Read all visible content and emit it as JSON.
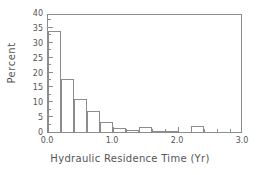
{
  "chart_data": {
    "type": "bar",
    "title": "",
    "subtitle": "",
    "xlabel": "Hydraulic Residence Time (Yr)",
    "ylabel": "Percent",
    "xlim": [
      0.0,
      3.0
    ],
    "ylim": [
      0,
      40
    ],
    "grid": false,
    "legend": null,
    "bin_width": 0.2,
    "categories": [
      "0.0-0.2",
      "0.2-0.4",
      "0.4-0.6",
      "0.6-0.8",
      "0.8-1.0",
      "1.0-1.2",
      "1.2-1.4",
      "1.4-1.6",
      "1.6-1.8",
      "1.8-2.0",
      "2.0-2.2",
      "2.2-2.4"
    ],
    "bin_starts": [
      0.0,
      0.2,
      0.4,
      0.6,
      0.8,
      1.0,
      1.2,
      1.4,
      1.6,
      1.8,
      2.0,
      2.2
    ],
    "values": [
      33.8,
      17.8,
      11.0,
      7.0,
      3.5,
      1.3,
      0.7,
      1.8,
      0.5,
      0.3,
      0.0,
      1.9
    ],
    "xticks": [
      0.0,
      1.0,
      2.0,
      3.0
    ],
    "xtick_labels": [
      "0.0",
      "1.0",
      "2.0",
      "3.0"
    ],
    "xminor_ticks": [
      0.2,
      0.4,
      0.6,
      0.8,
      1.2,
      1.4,
      1.6,
      1.8,
      2.2,
      2.4,
      2.6,
      2.8
    ],
    "yticks": [
      0,
      5,
      10,
      15,
      20,
      25,
      30,
      35,
      40
    ],
    "ytick_labels": [
      "0",
      "5",
      "10",
      "15",
      "20",
      "25",
      "30",
      "35",
      "40"
    ],
    "yminor_ticks": [
      2.5,
      7.5,
      12.5,
      17.5,
      22.5,
      27.5,
      32.5,
      37.5
    ],
    "colors": {
      "bar_edge": "#8c8c8c",
      "bar_fill": "transparent",
      "axis": "#8c8c8c",
      "text": "#555555",
      "background": "#ffffff"
    }
  }
}
